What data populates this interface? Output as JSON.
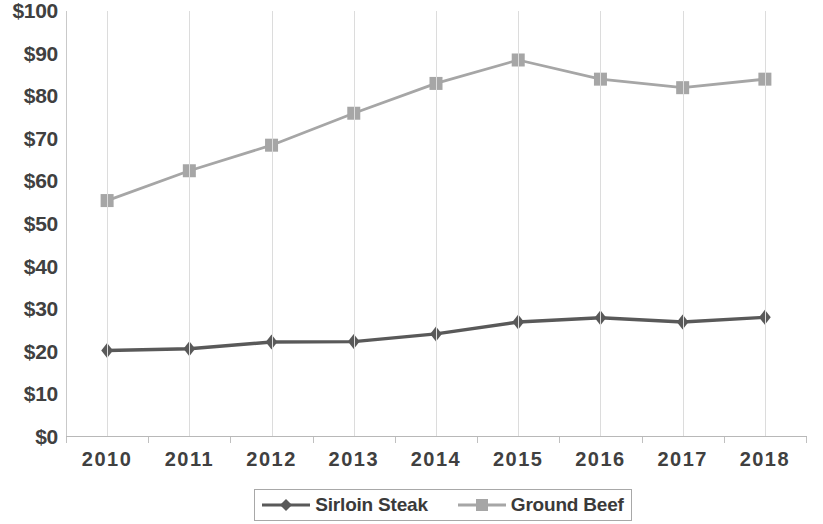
{
  "chart_data": {
    "type": "line",
    "title": "",
    "subtitle": "",
    "xlabel": "",
    "ylabel": "",
    "categories": [
      "2010",
      "2011",
      "2012",
      "2013",
      "2014",
      "2015",
      "2016",
      "2017",
      "2018"
    ],
    "x": [
      2010,
      2011,
      2012,
      2013,
      2014,
      2015,
      2016,
      2017,
      2018
    ],
    "series": [
      {
        "name": "Sirloin Steak",
        "color": "#595959",
        "marker": "diamond",
        "values": [
          20.3,
          20.7,
          22.3,
          22.4,
          24.2,
          27.0,
          28.0,
          27.0,
          28.1
        ]
      },
      {
        "name": "Ground Beef",
        "color": "#a6a6a6",
        "marker": "square",
        "values": [
          55.5,
          62.5,
          68.5,
          76.0,
          83.0,
          88.5,
          84.0,
          82.0,
          84.0
        ]
      }
    ],
    "ylim": [
      0,
      100
    ],
    "y_ticks": [
      0,
      10,
      20,
      30,
      40,
      50,
      60,
      70,
      80,
      90,
      100
    ],
    "y_tick_labels": [
      "$0",
      "$10",
      "$20",
      "$30",
      "$40",
      "$50",
      "$60",
      "$70",
      "$80",
      "$90",
      "$100"
    ],
    "grid": {
      "vertical": true,
      "horizontal": false
    },
    "legend": {
      "position": "bottom",
      "bordered": true,
      "entries": [
        "Sirloin Steak",
        "Ground Beef"
      ]
    },
    "colors": {
      "sirloin_steak": "#595959",
      "ground_beef": "#a6a6a6",
      "gridline": "#dcdcdc",
      "axis": "#c0c0c0",
      "text": "#404040",
      "background": "#ffffff"
    }
  }
}
